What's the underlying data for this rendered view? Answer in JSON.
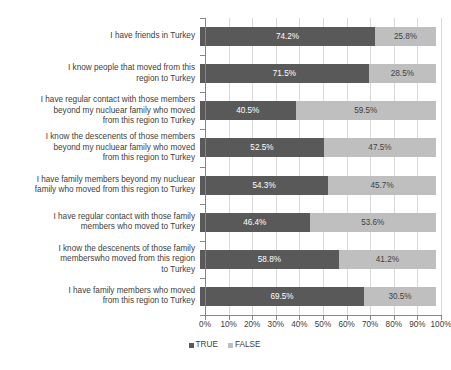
{
  "chart_data": {
    "type": "bar",
    "orientation": "horizontal",
    "stacked": true,
    "stack_mode": "percent",
    "title": "",
    "xlabel": "",
    "ylabel": "",
    "xlim": [
      0,
      100
    ],
    "grid": true,
    "legend_position": "bottom",
    "xticks": [
      "0%",
      "10%",
      "20%",
      "30%",
      "40%",
      "50%",
      "60%",
      "70%",
      "80%",
      "90%",
      "100%"
    ],
    "xtick_values": [
      0,
      10,
      20,
      30,
      40,
      50,
      60,
      70,
      80,
      90,
      100
    ],
    "categories": [
      "I have friends in Turkey",
      "I know people that moved from this\nregion to Turkey",
      "I have regular contact with those members\nbeyond my nucluear family who moved\nfrom this region to Turkey",
      "I know the descenents of those members\nbeyond my nucluear family who moved\nfrom this region to Turkey",
      "I have family members beyond my nucluear\nfamily who moved from this region to Turkey",
      "I have regular contact with those family\nmembers who moved to Turkey",
      "I know the descenents of those family\nmemberswho moved from this region\nto Turkey",
      "I have family members who moved\nfrom this region to Turkey"
    ],
    "series": [
      {
        "name": "TRUE",
        "color": "#595959",
        "values": [
          74.2,
          71.5,
          40.5,
          52.5,
          54.3,
          46.4,
          58.8,
          69.5
        ],
        "labels": [
          "74.2%",
          "71.5%",
          "40.5%",
          "52.5%",
          "54.3%",
          "46.4%",
          "58.8%",
          "69.5%"
        ]
      },
      {
        "name": "FALSE",
        "color": "#bfbfbf",
        "values": [
          25.8,
          28.5,
          59.5,
          47.5,
          45.7,
          53.6,
          41.2,
          30.5
        ],
        "labels": [
          "25.8%",
          "28.5%",
          "59.5%",
          "47.5%",
          "45.7%",
          "53.6%",
          "41.2%",
          "30.5%"
        ]
      }
    ],
    "legend": [
      {
        "label": "TRUE",
        "color": "#595959"
      },
      {
        "label": "FALSE",
        "color": "#bfbfbf"
      }
    ]
  },
  "colors": {
    "true_series": "#595959",
    "false_series": "#bfbfbf",
    "gridline": "#d9d9d9",
    "axis": "#868686",
    "text": "#404040",
    "background": "#ffffff"
  }
}
